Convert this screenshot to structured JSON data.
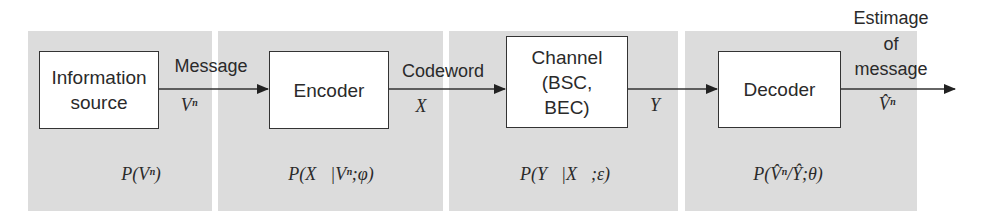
{
  "diagram": {
    "title": "",
    "type": "communication-system block diagram",
    "panels": [
      {
        "id": "source",
        "distribution": "P(Vⁿ)"
      },
      {
        "id": "encoder",
        "distribution": "P(X⃗|Vⁿ;φ)"
      },
      {
        "id": "channel",
        "distribution": "P(Y⃗|X⃗;ε)"
      },
      {
        "id": "decoder",
        "distribution": "P(V̂ⁿ/Ŷ;θ)"
      }
    ],
    "blocks": [
      {
        "id": "source",
        "lines": [
          "Information",
          "source"
        ]
      },
      {
        "id": "encoder",
        "lines": [
          "Encoder"
        ]
      },
      {
        "id": "channel",
        "lines": [
          "Channel",
          "(BSC,",
          "BEC)"
        ]
      },
      {
        "id": "decoder",
        "lines": [
          "Decoder"
        ]
      }
    ],
    "edges": [
      {
        "from": "source",
        "to": "encoder",
        "label": "Message",
        "symbol": "Vⁿ"
      },
      {
        "from": "encoder",
        "to": "channel",
        "label": "Codeword",
        "symbol": "X⃗"
      },
      {
        "from": "channel",
        "to": "decoder",
        "label": "",
        "symbol": "Y⃗"
      },
      {
        "from": "decoder",
        "to": "output",
        "label_lines": [
          "Estimage",
          "of",
          "message"
        ],
        "symbol": "V̂ⁿ"
      }
    ],
    "colors": {
      "panel": "#dcdcdc",
      "box": "#ffffff",
      "line": "#333333"
    }
  }
}
